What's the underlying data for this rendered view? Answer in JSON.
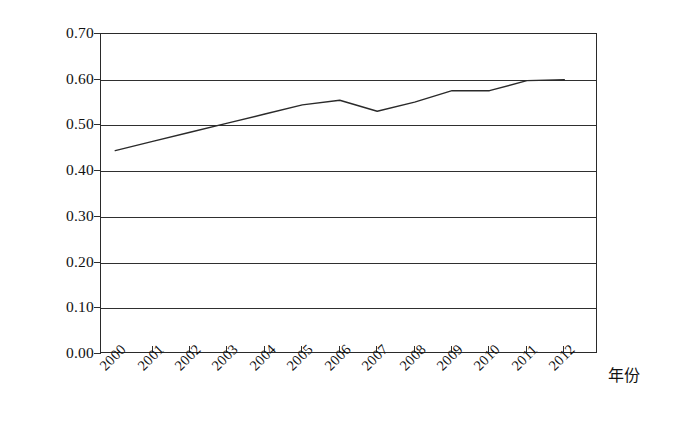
{
  "chart_data": {
    "type": "line",
    "title": "",
    "subtitle": "",
    "xlabel": "年份",
    "ylabel": "",
    "categories": [
      "2000",
      "2001",
      "2002",
      "2003",
      "2004",
      "2005",
      "2006",
      "2007",
      "2008",
      "2009",
      "2010",
      "2011",
      "2012"
    ],
    "x": [
      2000,
      2001,
      2002,
      2003,
      2004,
      2005,
      2006,
      2007,
      2008,
      2009,
      2010,
      2011,
      2012
    ],
    "series": [
      {
        "name": "",
        "values": [
          0.445,
          0.465,
          0.485,
          0.505,
          0.525,
          0.545,
          0.555,
          0.531,
          0.551,
          0.576,
          0.576,
          0.598,
          0.6
        ]
      }
    ],
    "ylim": [
      0.0,
      0.7
    ],
    "ytick_values": [
      0.0,
      0.1,
      0.2,
      0.3,
      0.4,
      0.5,
      0.6,
      0.7
    ],
    "ytick_labels": [
      "0.00",
      "0.10",
      "0.20",
      "0.30",
      "0.40",
      "0.50",
      "0.60",
      "0.70"
    ],
    "grid": true,
    "grid_axis": "y",
    "legend": false,
    "legend_position": "none",
    "line_color": "#2a2a2a",
    "line_width": 1.4,
    "markers": false,
    "plot_background": "#ffffff",
    "border": true,
    "xtick_rotation": -45
  },
  "axes": {
    "y": {
      "ticks": [
        {
          "label": "0.70",
          "value": 0.7
        },
        {
          "label": "0.60",
          "value": 0.6
        },
        {
          "label": "0.50",
          "value": 0.5
        },
        {
          "label": "0.40",
          "value": 0.4
        },
        {
          "label": "0.30",
          "value": 0.3
        },
        {
          "label": "0.20",
          "value": 0.2
        },
        {
          "label": "0.10",
          "value": 0.1
        },
        {
          "label": "0.00",
          "value": 0.0
        }
      ]
    },
    "x": {
      "title": "年份",
      "ticks": [
        {
          "label": "2000"
        },
        {
          "label": "2001"
        },
        {
          "label": "2002"
        },
        {
          "label": "2003"
        },
        {
          "label": "2004"
        },
        {
          "label": "2005"
        },
        {
          "label": "2006"
        },
        {
          "label": "2007"
        },
        {
          "label": "2008"
        },
        {
          "label": "2009"
        },
        {
          "label": "2010"
        },
        {
          "label": "2011"
        },
        {
          "label": "2012"
        }
      ]
    }
  }
}
